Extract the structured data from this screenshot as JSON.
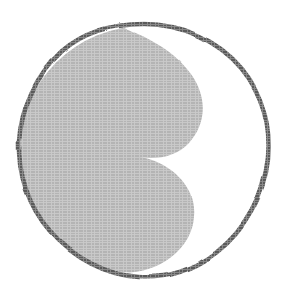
{
  "figure": {
    "name": "taijitu-yin-yang-symbol",
    "title": "Yin-Yang (Taijitu)",
    "style": "hand-drawn scanned line art",
    "canvas": {
      "width": 291,
      "height": 305
    },
    "background_color": "#ffffff"
  },
  "colors": {
    "background": "#ffffff",
    "outline_stroke": "#5a5a5a",
    "yin_fill_gray": "#b4b4b4",
    "yang_fill_white": "#ffffff",
    "halftone_tone": "#aeaeae"
  },
  "geometry": {
    "circle": {
      "center_x": 144,
      "center_y": 150,
      "radius": 126,
      "bounds": {
        "left": 18,
        "top": 22,
        "right": 270,
        "bottom": 278
      },
      "stroke_width": 4.6
    },
    "divider": {
      "type": "s-curve",
      "inflection_x": 112,
      "inflection_y": 140,
      "upper_lobe": {
        "side": "white",
        "center_x": 168,
        "center_y": 86,
        "radius": 62
      },
      "lower_lobe": {
        "side": "gray",
        "center_x": 122,
        "center_y": 212,
        "radius": 64
      }
    }
  },
  "regions": [
    {
      "id": "yin-region",
      "label": "Yin (shaded half)",
      "fill": "#b4b4b4",
      "position": "left and lower-right lobe"
    },
    {
      "id": "yang-region",
      "label": "Yang (unshaded half)",
      "fill": "#ffffff",
      "position": "right and upper-left lobe"
    }
  ],
  "outline": {
    "id": "circle-outline",
    "label": "Outer circle",
    "stroke": "#5a5a5a"
  }
}
